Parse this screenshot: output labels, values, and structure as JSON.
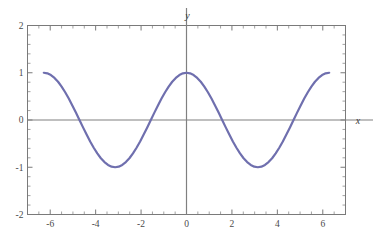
{
  "figure": {
    "background_color": "#ffffff",
    "frame_color": "#7a7a7a",
    "axis_color": "#808080",
    "tick_label_color": "#4a4a4a",
    "width": 373,
    "height": 241
  },
  "chart_data": {
    "type": "line",
    "title": "",
    "subtitle": "",
    "xlabel": "x",
    "ylabel": "y",
    "legend": [],
    "legend_position": "none",
    "grid": false,
    "frame": true,
    "line_color": "#6f6fae",
    "line_width": 2.2,
    "xlim": [
      -7,
      7
    ],
    "ylim": [
      -2,
      2
    ],
    "x_major_ticks": [
      -6,
      -4,
      -2,
      0,
      2,
      4,
      6
    ],
    "x_major_tick_labels": [
      "-6",
      "-4",
      "-2",
      "0",
      "2",
      "4",
      "6"
    ],
    "x_minor_tick_step": 0.5,
    "y_major_ticks": [
      -2,
      -1,
      0,
      1,
      2
    ],
    "y_major_tick_labels": [
      "-2",
      "-1",
      "0",
      "1",
      "2"
    ],
    "y_minor_tick_step": 0.2,
    "function": "cos(x)",
    "x_domain": [
      -6.2831853,
      6.2831853
    ],
    "x": [
      -6.2831853,
      -6.1261057,
      -5.969026,
      -5.8119464,
      -5.6548668,
      -5.4977871,
      -5.3407075,
      -5.1836279,
      -5.0265482,
      -4.8694686,
      -4.712389,
      -4.5553093,
      -4.3982297,
      -4.2411501,
      -4.0840704,
      -3.9269908,
      -3.7699112,
      -3.6128316,
      -3.4557519,
      -3.2986723,
      -3.1415927,
      -2.984513,
      -2.8274334,
      -2.6703538,
      -2.5132741,
      -2.3561945,
      -2.1991149,
      -2.0420352,
      -1.8849556,
      -1.727876,
      -1.5707963,
      -1.4137167,
      -1.2566371,
      -1.0995574,
      -0.9424778,
      -0.7853982,
      -0.6283185,
      -0.4712389,
      -0.3141593,
      -0.1570796,
      0,
      0.1570796,
      0.3141593,
      0.4712389,
      0.6283185,
      0.7853982,
      0.9424778,
      1.0995574,
      1.2566371,
      1.4137167,
      1.5707963,
      1.727876,
      1.8849556,
      2.0420352,
      2.1991149,
      2.3561945,
      2.5132741,
      2.6703538,
      2.8274334,
      2.984513,
      3.1415927,
      3.2986723,
      3.4557519,
      3.6128316,
      3.7699112,
      3.9269908,
      4.0840704,
      4.2411501,
      4.3982297,
      4.5553093,
      4.712389,
      4.8694686,
      5.0265482,
      5.1836279,
      5.3407075,
      5.4977871,
      5.6548668,
      5.8119464,
      5.969026,
      6.1261057,
      6.2831853
    ],
    "y": [
      1,
      0.9876883,
      0.9510565,
      0.8910065,
      0.809017,
      0.7071068,
      0.5877853,
      0.4539905,
      0.309017,
      0.1564345,
      0,
      -0.1564345,
      -0.309017,
      -0.4539905,
      -0.5877853,
      -0.7071068,
      -0.809017,
      -0.8910065,
      -0.9510565,
      -0.9876883,
      -1,
      -0.9876883,
      -0.9510565,
      -0.8910065,
      -0.809017,
      -0.7071068,
      -0.5877853,
      -0.4539905,
      -0.309017,
      -0.1564345,
      0,
      0.1564345,
      0.309017,
      0.4539905,
      0.5877853,
      0.7071068,
      0.809017,
      0.8910065,
      0.9510565,
      0.9876883,
      1,
      0.9876883,
      0.9510565,
      0.8910065,
      0.809017,
      0.7071068,
      0.5877853,
      0.4539905,
      0.309017,
      0.1564345,
      0,
      -0.1564345,
      -0.309017,
      -0.4539905,
      -0.5877853,
      -0.7071068,
      -0.809017,
      -0.8910065,
      -0.9510565,
      -0.9876883,
      -1,
      -0.9876883,
      -0.9510565,
      -0.8910065,
      -0.809017,
      -0.7071068,
      -0.5877853,
      -0.4539905,
      -0.309017,
      -0.1564345,
      0,
      0.1564345,
      0.309017,
      0.4539905,
      0.5877853,
      0.7071068,
      0.809017,
      0.8910065,
      0.9510565,
      0.9876883,
      1
    ]
  },
  "axis_labels": {
    "x_name": "x",
    "y_name": "y"
  }
}
